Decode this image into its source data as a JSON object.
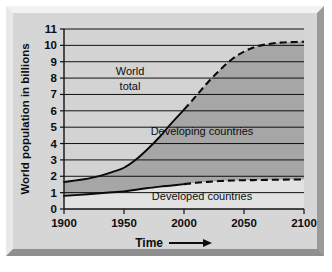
{
  "chart_data": {
    "type": "area",
    "title": "",
    "xlabel": "Time",
    "ylabel": "World population in billions",
    "xlim": [
      1900,
      2100
    ],
    "ylim": [
      0,
      11
    ],
    "grid": true,
    "legend_position": "in-plot-annotations",
    "x_ticks": [
      "1900",
      "1950",
      "2000",
      "2050",
      "2100"
    ],
    "x_tick_values": [
      1900,
      1950,
      2000,
      2050,
      2100
    ],
    "y_ticks": [
      "0",
      "1",
      "2",
      "3",
      "4",
      "5",
      "6",
      "7",
      "8",
      "9",
      "10",
      "11"
    ],
    "y_tick_values": [
      0,
      1,
      2,
      3,
      4,
      5,
      6,
      7,
      8,
      9,
      10,
      11
    ],
    "x": [
      1900,
      1910,
      1920,
      1930,
      1940,
      1950,
      1960,
      1970,
      1980,
      1990,
      2000,
      2010,
      2020,
      2030,
      2040,
      2050,
      2060,
      2070,
      2080,
      2090,
      2100
    ],
    "projection_starts_at": 2000,
    "series": [
      {
        "name": "World total",
        "values": [
          1.65,
          1.75,
          1.86,
          2.02,
          2.25,
          2.52,
          3.02,
          3.68,
          4.43,
          5.28,
          6.07,
          6.9,
          7.75,
          8.5,
          9.15,
          9.62,
          9.92,
          10.08,
          10.17,
          10.2,
          10.22
        ],
        "style": "solid-then-dashed"
      },
      {
        "name": "Developed countries",
        "values": [
          0.8,
          0.85,
          0.9,
          0.96,
          1.02,
          1.08,
          1.18,
          1.28,
          1.37,
          1.44,
          1.52,
          1.6,
          1.66,
          1.71,
          1.74,
          1.76,
          1.77,
          1.78,
          1.79,
          1.8,
          1.8
        ],
        "style": "solid-then-dashed"
      },
      {
        "name": "Developing countries",
        "values": [
          0.85,
          0.9,
          0.96,
          1.06,
          1.23,
          1.44,
          1.84,
          2.4,
          3.06,
          3.84,
          4.55,
          5.3,
          6.09,
          6.79,
          7.41,
          7.86,
          8.15,
          8.3,
          8.38,
          8.4,
          8.42
        ],
        "style": "band-between-developed-and-world-total"
      }
    ],
    "annotations": [
      {
        "text": "World",
        "x": 1955,
        "y": 8.2
      },
      {
        "text": "total",
        "x": 1955,
        "y": 7.3
      },
      {
        "text": "Developing countries",
        "x": 2015,
        "y": 4.5
      },
      {
        "text": "Developed countries",
        "x": 2015,
        "y": 0.55
      }
    ],
    "colors": {
      "band_outer": "#d3d3d3",
      "band_developing": "#a6a6a6",
      "band_developed": "#e2e2e2",
      "line": "#0a0a0a",
      "grid": "#111111",
      "panel": "#d6d6d6",
      "frame": "#c9c9c9"
    }
  },
  "axes": {
    "y_title": "World population in billions",
    "x_title": "Time",
    "x_title_arrow": "⟶"
  },
  "annotations": {
    "world_total_line1": "World",
    "world_total_line2": "total",
    "developing": "Developing countries",
    "developed": "Developed countries"
  },
  "y_tick_labels": [
    "11",
    "10",
    "9",
    "8",
    "7",
    "6",
    "5",
    "4",
    "3",
    "2",
    "1",
    "0"
  ],
  "x_tick_labels": [
    "1900",
    "1950",
    "2000",
    "2050",
    "2100"
  ]
}
